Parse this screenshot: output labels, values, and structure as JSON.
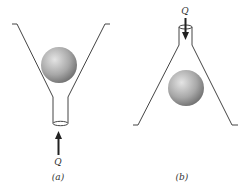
{
  "figure": {
    "panels": [
      {
        "id": "a",
        "caption": "(a)",
        "flow_label": "Q",
        "flow_direction": "up",
        "description": "Ball in upright funnel with flow from below"
      },
      {
        "id": "b",
        "caption": "(b)",
        "flow_label": "Q",
        "flow_direction": "down",
        "description": "Ball in inverted funnel with flow from above"
      }
    ],
    "colors": {
      "line": "#444444",
      "ball_light": "#e0e0e0",
      "ball_dark": "#7a7a7a",
      "arrow": "#222222"
    }
  }
}
